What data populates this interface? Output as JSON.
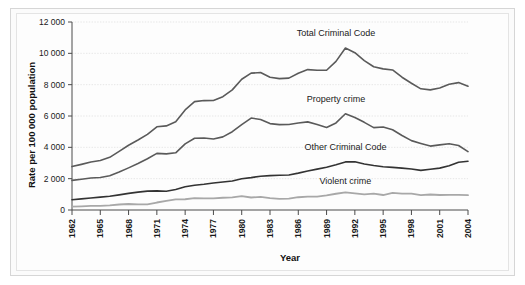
{
  "figure": {
    "background": "#fbfbfb",
    "panel_background": "#fdfdfd",
    "frame_color": "#d6d6d6"
  },
  "chart_data": {
    "type": "line",
    "title": "",
    "xlabel": "Year",
    "ylabel": "Rate per 100 000 population",
    "xlim": [
      1962,
      2004
    ],
    "ylim": [
      0,
      12000
    ],
    "grid": true,
    "legend_position": "inline-annotations",
    "ytick_labels": [
      "0",
      "2 000",
      "4 000",
      "6 000",
      "8 000",
      "10 000",
      "12 000"
    ],
    "ytick_values": [
      0,
      2000,
      4000,
      6000,
      8000,
      10000,
      12000
    ],
    "xtick_labels": [
      "1962",
      "1965",
      "1968",
      "1971",
      "1974",
      "1977",
      "1980",
      "1983",
      "1986",
      "1989",
      "1992",
      "1995",
      "1998",
      "2001",
      "2004"
    ],
    "xtick_values": [
      1962,
      1965,
      1968,
      1971,
      1974,
      1977,
      1980,
      1983,
      1986,
      1989,
      1992,
      1995,
      1998,
      2001,
      2004
    ],
    "x": [
      1962,
      1963,
      1964,
      1965,
      1966,
      1967,
      1968,
      1969,
      1970,
      1971,
      1972,
      1973,
      1974,
      1975,
      1976,
      1977,
      1978,
      1979,
      1980,
      1981,
      1982,
      1983,
      1984,
      1985,
      1986,
      1987,
      1988,
      1989,
      1990,
      1991,
      1992,
      1993,
      1994,
      1995,
      1996,
      1997,
      1998,
      1999,
      2000,
      2001,
      2002,
      2003,
      2004
    ],
    "series": [
      {
        "name": "Total Criminal Code",
        "color": "#5a5a5a",
        "width": 1.6,
        "label_x": 1990,
        "label_y": 11100,
        "values": [
          2771,
          2913,
          3069,
          3159,
          3362,
          3740,
          4135,
          4465,
          4827,
          5312,
          5368,
          5638,
          6388,
          6915,
          6984,
          6985,
          7236,
          7666,
          8343,
          8736,
          8774,
          8470,
          8387,
          8415,
          8726,
          8962,
          8919,
          8919,
          9485,
          10342,
          10040,
          9538,
          9141,
          9008,
          8938,
          8475,
          8091,
          7734,
          7666,
          7790,
          8023,
          8132,
          7905
        ]
      },
      {
        "name": "Property crime",
        "color": "#5a5a5a",
        "width": 1.6,
        "label_x": 1990,
        "label_y": 6900,
        "values": [
          1891,
          1965,
          2042,
          2070,
          2183,
          2419,
          2690,
          2967,
          3268,
          3614,
          3585,
          3651,
          4221,
          4581,
          4595,
          4529,
          4669,
          4999,
          5454,
          5869,
          5776,
          5515,
          5450,
          5453,
          5555,
          5625,
          5452,
          5262,
          5559,
          6141,
          5903,
          5596,
          5260,
          5294,
          5125,
          4758,
          4429,
          4249,
          4079,
          4158,
          4234,
          4118,
          3727
        ]
      },
      {
        "name": "Other Criminal Code",
        "color": "#333333",
        "width": 1.6,
        "label_x": 1991,
        "label_y": 3860,
        "values": [
          656,
          712,
          766,
          820,
          876,
          966,
          1059,
          1142,
          1204,
          1219,
          1200,
          1311,
          1479,
          1579,
          1641,
          1718,
          1784,
          1853,
          1999,
          2068,
          2159,
          2196,
          2221,
          2236,
          2354,
          2486,
          2610,
          2725,
          2887,
          3070,
          3075,
          2940,
          2837,
          2756,
          2720,
          2670,
          2616,
          2530,
          2597,
          2674,
          2825,
          3048,
          3110
        ]
      },
      {
        "name": "Violent crime",
        "color": "#a8a8a8",
        "width": 1.8,
        "label_x": 1991,
        "label_y": 1680,
        "values": [
          221,
          234,
          258,
          267,
          300,
          352,
          384,
          354,
          353,
          478,
          581,
          674,
          686,
          753,
          747,
          736,
          781,
          812,
          889,
          797,
          838,
          757,
          714,
          724,
          815,
          849,
          855,
          930,
          1037,
          1129,
          1060,
          1000,
          1042,
          957,
          1091,
          1045,
          1045,
          953,
          988,
          956,
          962,
          964,
          944
        ]
      }
    ]
  }
}
